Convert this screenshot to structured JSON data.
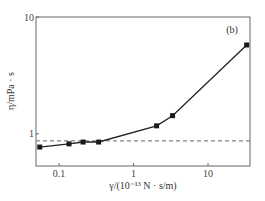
{
  "chart_data": {
    "type": "line",
    "panel_label": "(b)",
    "xlabel": "γ/(10⁻¹³ N · s/m)",
    "ylabel": "η/mPa · s",
    "xscale": "log",
    "yscale": "log",
    "xlim": [
      0.049,
      36.6
    ],
    "ylim": [
      0.53,
      10
    ],
    "xticks": [
      {
        "value": 0.1,
        "label": "0.1"
      },
      {
        "value": 1,
        "label": "1"
      },
      {
        "value": 10,
        "label": "10"
      }
    ],
    "yticks": [
      {
        "value": 1,
        "label": "1"
      },
      {
        "value": 10,
        "label": "10"
      }
    ],
    "grid": false,
    "series": [
      {
        "name": "measured",
        "style": "solid-line-square-markers",
        "x": [
          0.055,
          0.136,
          0.21,
          0.34,
          2.04,
          3.34,
          33
        ],
        "y": [
          0.77,
          0.82,
          0.85,
          0.85,
          1.17,
          1.43,
          5.76
        ]
      },
      {
        "name": "reference",
        "style": "dashed-horizontal",
        "y": 0.87
      }
    ]
  }
}
